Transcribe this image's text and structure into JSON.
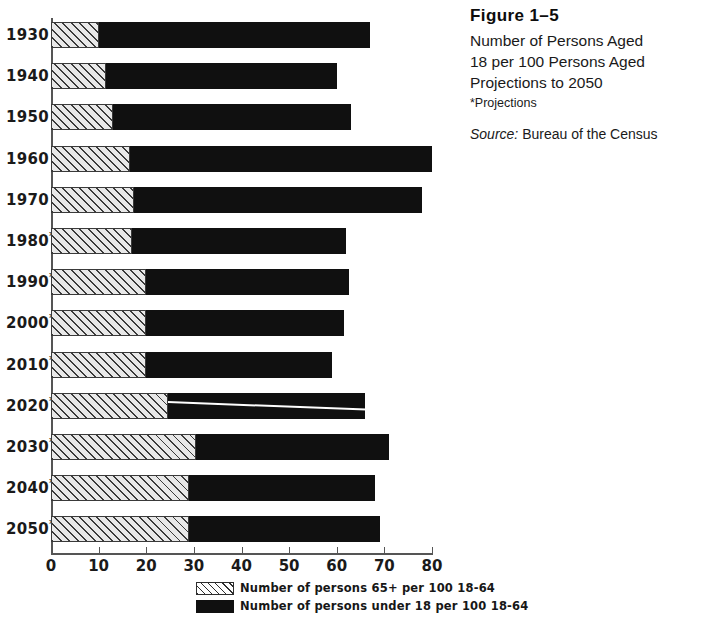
{
  "caption": {
    "figure_number": "Figure 1–5",
    "title_lines": [
      "Number of Persons Aged",
      "18 per 100 Persons Aged",
      "Projections to 2050"
    ],
    "note": "*Projections",
    "source_label": "Source:",
    "source_value": " Bureau of the Census"
  },
  "legend": {
    "items": [
      {
        "swatch": "hatched",
        "label": "Number of persons 65+ per 100 18-64"
      },
      {
        "swatch": "solid-black",
        "label": "Number of persons under 18 per 100 18-64"
      }
    ]
  },
  "axis": {
    "x_ticks": [
      "0",
      "10",
      "20",
      "30",
      "40",
      "50",
      "60",
      "70",
      "80"
    ],
    "x_min": 0,
    "x_max": 80
  },
  "chart_data": {
    "type": "bar",
    "orientation": "horizontal",
    "stacked": true,
    "title": "Number of Persons Aged 18 per 100 Persons Aged Projections to 2050",
    "xlabel": "",
    "ylabel": "",
    "xlim": [
      0,
      80
    ],
    "grid": false,
    "legend_position": "bottom",
    "categories": [
      "1930",
      "1940",
      "1950",
      "1960",
      "1970",
      "1980*",
      "1990*",
      "2000*",
      "2010*",
      "2020*",
      "2030*",
      "2040*",
      "2050*"
    ],
    "series": [
      {
        "name": "Number of persons 65+ per 100 18-64",
        "pattern": "hatched",
        "values": [
          10,
          11.5,
          13,
          16.5,
          17.5,
          17,
          20,
          20,
          20,
          24.5,
          30.5,
          29,
          29
        ]
      },
      {
        "name": "Number of persons under 18 per 100 18-64",
        "pattern": "solid-black",
        "values": [
          57,
          48.5,
          50,
          63.5,
          60.5,
          45,
          42.5,
          41.5,
          39,
          41.5,
          40.5,
          39,
          40
        ]
      }
    ],
    "totals": [
      67,
      60,
      63,
      80,
      78,
      62,
      62.5,
      61.5,
      59,
      66,
      71,
      68,
      69
    ]
  }
}
